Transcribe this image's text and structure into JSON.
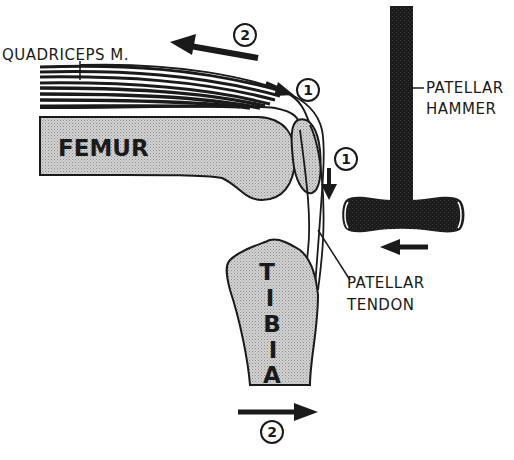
{
  "diagram": {
    "type": "anatomical illustration",
    "labels": {
      "quadriceps": "QUADRICEPS M.",
      "femur": "FEMUR",
      "tibia_letters": [
        "T",
        "I",
        "B",
        "I",
        "A"
      ],
      "hammer_line1": "PATELLAR",
      "hammer_line2": "HAMMER",
      "tendon_line1": "PATELLAR",
      "tendon_line2": "TENDON"
    },
    "step_markers": {
      "stretch_quadriceps": "1",
      "tendon_pull": "1",
      "muscle_contraction": "2",
      "leg_kick": "2"
    },
    "arrows": [
      {
        "id": "contraction",
        "step": "2",
        "direction": "left-up"
      },
      {
        "id": "stretch",
        "step": "1",
        "direction": "right-down"
      },
      {
        "id": "tendon-down",
        "step": "1",
        "direction": "down"
      },
      {
        "id": "hammer-strike",
        "direction": "left"
      },
      {
        "id": "tibia-kick",
        "step": "2",
        "direction": "right"
      }
    ],
    "colors": {
      "ink": "#1a1a1a",
      "bone_fill": "#c8c8c8",
      "background": "#ffffff"
    }
  }
}
